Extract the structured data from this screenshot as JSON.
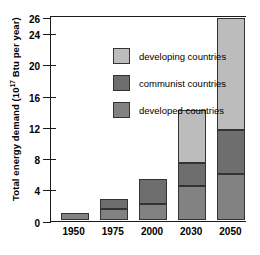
{
  "chart_data": {
    "type": "bar",
    "subtype": "stacked-bar",
    "title": "",
    "xlabel": "",
    "ylabel": "Total energy demand (10¹⁷ Btu per year)",
    "ylabel_prefix": "Total energy demand (10",
    "ylabel_exponent": "17",
    "ylabel_suffix": " Btu per year)",
    "categories": [
      "1950",
      "1975",
      "2000",
      "2030",
      "2050"
    ],
    "ylim": [
      0,
      26
    ],
    "yticks": [
      0,
      4,
      8,
      12,
      16,
      20,
      24,
      26
    ],
    "ytick_labels": [
      "0",
      "4",
      "8",
      "12",
      "16",
      "20",
      "24",
      "26"
    ],
    "grid": false,
    "legend_position": "upper left",
    "series": [
      {
        "name": "developed countries",
        "color": "#828282",
        "values": [
          0.9,
          1.4,
          2.0,
          4.3,
          5.8
        ]
      },
      {
        "name": "communist countries",
        "color": "#6e6e6e",
        "values": [
          0.0,
          1.2,
          3.2,
          3.0,
          5.7
        ]
      },
      {
        "name": "developing countries",
        "color": "#bcbcbc",
        "values": [
          0.0,
          0.0,
          0.0,
          6.7,
          14.3
        ]
      }
    ],
    "totals": [
      0.9,
      2.6,
      5.2,
      14.0,
      25.8
    ],
    "legend": [
      {
        "label": "developing countries",
        "color": "#bcbcbc"
      },
      {
        "label": "communist countries",
        "color": "#6e6e6e"
      },
      {
        "label": "developed countries",
        "color": "#828282"
      }
    ]
  }
}
